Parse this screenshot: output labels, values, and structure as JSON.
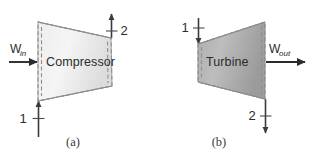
{
  "figure": {
    "background_color": "#ffffff",
    "panels": [
      {
        "id": "compressor-panel",
        "caption": "(a)",
        "device_label": "Compressor",
        "device_fill_light": "#f2f2f2",
        "device_fill_dark": "#d2d2d2",
        "border_color": "#8e8e8e",
        "work": {
          "symbol": "W",
          "subscript": "in",
          "direction": "in",
          "arrow_color": "#2b2b2b"
        },
        "states": [
          {
            "label": "1",
            "position": "bottom-left",
            "direction": "up"
          },
          {
            "label": "2",
            "position": "top-right",
            "direction": "up"
          }
        ]
      },
      {
        "id": "turbine-panel",
        "caption": "(b)",
        "device_label": "Turbine",
        "device_fill_light": "#c9c9c9",
        "device_fill_dark": "#9a9a9a",
        "border_color": "#8e8e8e",
        "work": {
          "symbol": "W",
          "subscript": "out",
          "direction": "out",
          "arrow_color": "#2b2b2b"
        },
        "states": [
          {
            "label": "1",
            "position": "top-left",
            "direction": "down"
          },
          {
            "label": "2",
            "position": "bottom-right",
            "direction": "down"
          }
        ]
      }
    ]
  }
}
